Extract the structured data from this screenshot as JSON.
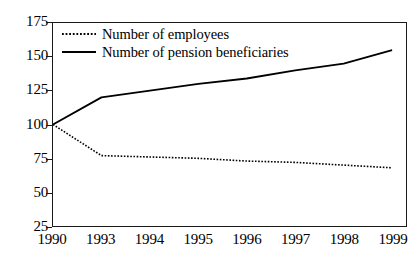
{
  "chart_data": {
    "type": "line",
    "title": "",
    "subtitle": "",
    "xlabel": "",
    "ylabel": "",
    "categories": [
      "1990",
      "1993",
      "1994",
      "1995",
      "1996",
      "1997",
      "1998",
      "1999"
    ],
    "ylim": [
      25,
      175
    ],
    "yticks": [
      175,
      150,
      125,
      100,
      75,
      50,
      25
    ],
    "ytick_labels": [
      "175",
      "150",
      "125",
      "100",
      "75",
      "50",
      "25"
    ],
    "grid": false,
    "legend_position": "top-left",
    "series": [
      {
        "name": "Number of employees",
        "style": "dotted",
        "color": "#000000",
        "values": [
          100,
          77,
          76,
          75,
          73,
          72,
          70,
          68
        ]
      },
      {
        "name": "Number of pension beneficiaries",
        "style": "solid",
        "color": "#000000",
        "values": [
          100,
          120,
          125,
          130,
          134,
          140,
          145,
          155
        ]
      }
    ]
  }
}
